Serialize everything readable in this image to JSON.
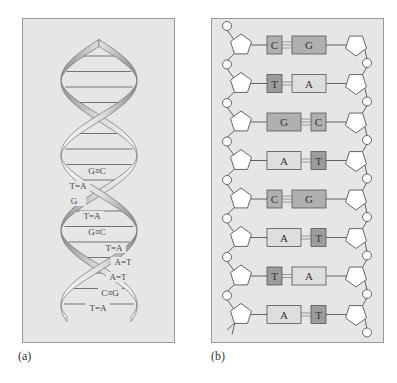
{
  "figure": {
    "panels": [
      {
        "id": "a",
        "caption": "(a)",
        "description": "Double helix ribbon with base pairs",
        "base_pairs": [
          {
            "label": "G≡C",
            "x": 96,
            "y": 172
          },
          {
            "label": "T=A",
            "x": 77,
            "y": 187
          },
          {
            "label": "G",
            "x": 73,
            "y": 202
          },
          {
            "label": "T=A",
            "x": 91,
            "y": 217
          },
          {
            "label": "G≡C",
            "x": 96,
            "y": 233
          },
          {
            "label": "T=A",
            "x": 113,
            "y": 249
          },
          {
            "label": "A=T",
            "x": 122,
            "y": 263
          },
          {
            "label": "A=T",
            "x": 117,
            "y": 278
          },
          {
            "label": "C≡G",
            "x": 109,
            "y": 294
          },
          {
            "label": "T=A",
            "x": 97,
            "y": 309
          }
        ]
      },
      {
        "id": "b",
        "caption": "(b)",
        "description": "Ladder diagram: sugar-phosphate backbones with paired bases",
        "rows": [
          {
            "left": "C",
            "right": "G",
            "left_type": "pyrimidine",
            "right_type": "purine",
            "bonds": 3
          },
          {
            "left": "T",
            "right": "A",
            "left_type": "pyrimidine",
            "right_type": "purine",
            "bonds": 2
          },
          {
            "left": "G",
            "right": "C",
            "left_type": "purine",
            "right_type": "pyrimidine",
            "bonds": 3
          },
          {
            "left": "A",
            "right": "T",
            "left_type": "purine",
            "right_type": "pyrimidine",
            "bonds": 2
          },
          {
            "left": "C",
            "right": "G",
            "left_type": "pyrimidine",
            "right_type": "purine",
            "bonds": 3
          },
          {
            "left": "A",
            "right": "T",
            "left_type": "purine",
            "right_type": "pyrimidine",
            "bonds": 2
          },
          {
            "left": "T",
            "right": "A",
            "left_type": "pyrimidine",
            "right_type": "purine",
            "bonds": 2
          },
          {
            "left": "A",
            "right": "T",
            "left_type": "purine",
            "right_type": "pyrimidine",
            "bonds": 2
          }
        ]
      }
    ],
    "colors": {
      "panel_bg": "#e6e6e6",
      "panel_border": "#9a9a9a",
      "dark_base": "#a8a8a8",
      "light_base": "#dcdcdc",
      "ribbon_light": "#f4f4f4",
      "ribbon_dark": "#8e8e8e",
      "line": "#555555"
    }
  },
  "captions": {
    "a": "(a)",
    "b": "(b)"
  }
}
